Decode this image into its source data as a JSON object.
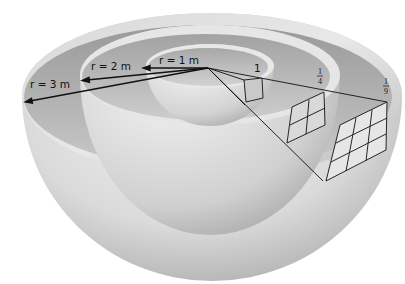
{
  "figure": {
    "shells": [
      {
        "radius_label": "r = 1 m",
        "area_fraction_label": "1",
        "grid": "1x1"
      },
      {
        "radius_label": "r = 2 m",
        "area_fraction_label": "1/4",
        "grid": "2x2"
      },
      {
        "radius_label": "r = 3 m",
        "area_fraction_label": "1/9",
        "grid": "3x3"
      }
    ],
    "fractions": {
      "one": "1",
      "quarter_num": "1",
      "quarter_den": "4",
      "ninth_num": "1",
      "ninth_den": "9"
    },
    "colors": {
      "background": "#ffffff",
      "shell_light": "#f2f2f2",
      "shell_mid": "#cfcfcf",
      "shell_dark": "#9e9e9e",
      "line": "#111111"
    }
  }
}
